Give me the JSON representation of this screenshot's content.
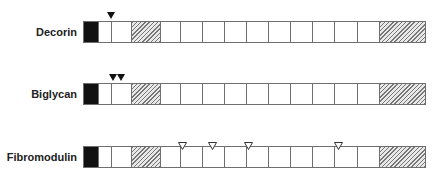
{
  "cells": [
    {
      "type": "black",
      "x": 0,
      "w": 15
    },
    {
      "type": "white",
      "x": 15,
      "w": 13
    },
    {
      "type": "white",
      "x": 28,
      "w": 20
    },
    {
      "type": "hatch",
      "x": 48,
      "w": 29
    },
    {
      "type": "white",
      "x": 77,
      "w": 20
    },
    {
      "type": "white",
      "x": 97,
      "w": 22
    },
    {
      "type": "white",
      "x": 119,
      "w": 22
    },
    {
      "type": "white",
      "x": 141,
      "w": 22
    },
    {
      "type": "white",
      "x": 163,
      "w": 22
    },
    {
      "type": "white",
      "x": 185,
      "w": 22
    },
    {
      "type": "white",
      "x": 207,
      "w": 22
    },
    {
      "type": "white",
      "x": 229,
      "w": 22
    },
    {
      "type": "white",
      "x": 251,
      "w": 23
    },
    {
      "type": "white",
      "x": 274,
      "w": 22
    },
    {
      "type": "hatch",
      "x": 296,
      "w": 47
    }
  ],
  "rows": [
    {
      "name": "Decorin",
      "bar_top": 21,
      "markers": [
        {
          "style": "filled",
          "x": 111
        }
      ]
    },
    {
      "name": "Biglycan",
      "bar_top": 83,
      "markers": [
        {
          "style": "filled",
          "x": 113
        },
        {
          "style": "filled",
          "x": 121
        }
      ]
    },
    {
      "name": "Fibromodulin",
      "bar_top": 146,
      "markers": [
        {
          "style": "open",
          "x": 182
        },
        {
          "style": "open",
          "x": 212
        },
        {
          "style": "open",
          "x": 248
        },
        {
          "style": "open",
          "x": 338
        }
      ]
    }
  ],
  "colors": {
    "fill_black": "#111111",
    "border": "#6e6e6e",
    "hatch": "#777777"
  }
}
